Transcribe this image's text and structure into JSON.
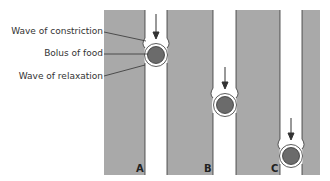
{
  "figure": {
    "labels": {
      "constriction": "Wave of constriction",
      "bolus": "Bolus of food",
      "relaxation": "Wave of relaxation"
    },
    "panels": [
      "A",
      "B",
      "C"
    ],
    "colors": {
      "wall": "#a9a9a9",
      "bolus": "#6b6b6b",
      "outline": "#333333",
      "background": "#ffffff"
    }
  }
}
